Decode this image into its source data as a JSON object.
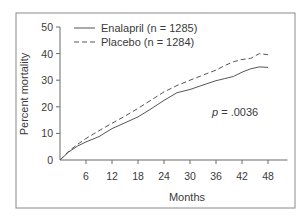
{
  "chart_data": {
    "type": "line",
    "title": "",
    "xlabel": "Months",
    "ylabel": "Percent mortality",
    "xlim": [
      0,
      52
    ],
    "ylim": [
      0,
      50
    ],
    "xticks": [
      6,
      12,
      18,
      24,
      30,
      36,
      42,
      48
    ],
    "yticks": [
      0,
      10,
      20,
      30,
      40,
      50
    ],
    "grid": false,
    "legend_position": "top-left",
    "series": [
      {
        "name": "Enalapril (n = 1285)",
        "style": "solid",
        "color": "#555555",
        "x": [
          0,
          2,
          4,
          6,
          9,
          12,
          15,
          18,
          21,
          24,
          27,
          30,
          33,
          36,
          38,
          40,
          42,
          44,
          46,
          48
        ],
        "y": [
          0,
          3,
          5.2,
          6.8,
          8.8,
          11.8,
          14,
          16.2,
          19.2,
          22.4,
          25.3,
          26.5,
          28.2,
          29.8,
          30.6,
          31.4,
          33,
          34.3,
          35,
          34.8
        ]
      },
      {
        "name": "Placebo (n = 1284)",
        "style": "dashed",
        "color": "#555555",
        "x": [
          0,
          2,
          4,
          6,
          9,
          12,
          15,
          18,
          21,
          24,
          27,
          30,
          33,
          36,
          38,
          40,
          42,
          44,
          46,
          48
        ],
        "y": [
          0,
          3.3,
          5.8,
          8.1,
          11,
          13.8,
          16.5,
          19.4,
          22.5,
          25.6,
          28,
          30,
          31.9,
          33.8,
          35.5,
          36.9,
          37.8,
          38.2,
          40,
          39.6
        ]
      }
    ],
    "annotations": [
      {
        "text_prefix": "p",
        "text_rest": " = .0036"
      }
    ]
  }
}
